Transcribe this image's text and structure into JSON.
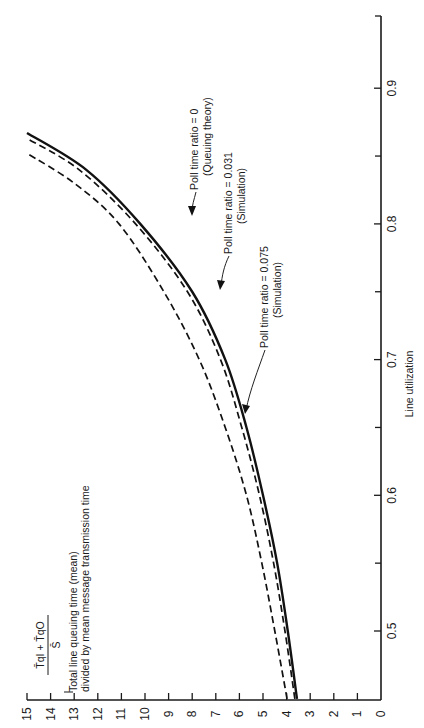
{
  "chart_data": {
    "type": "line",
    "orientation": "rotated-90-ccw",
    "title": "",
    "xlabel": "Line utilization",
    "ylabel": "Total line queuing time (mean) divided by mean message transmission time",
    "ylabel_formula": "(T̄q_I + T̄q_O) / S̄",
    "ylabel_lines": [
      "Total line queuing time (mean)",
      "divided by mean message transmission time"
    ],
    "formula": {
      "numerator": "T̄qI + T̄qO",
      "denominator": "S̄"
    },
    "xlim": [
      0.45,
      0.95
    ],
    "ylim": [
      0,
      15
    ],
    "x_ticks": [
      0.5,
      0.6,
      0.7,
      0.8,
      0.9
    ],
    "x_tick_labels": [
      "0.5",
      "0.6",
      "0.7",
      "0.8",
      "0.9"
    ],
    "x_minor_ticks": [
      0.55,
      0.65,
      0.75,
      0.85
    ],
    "y_ticks": [
      0,
      1,
      2,
      3,
      4,
      5,
      6,
      7,
      8,
      9,
      10,
      11,
      12,
      13,
      14,
      15
    ],
    "y_tick_labels": [
      "0",
      "1",
      "2",
      "3",
      "4",
      "5",
      "6",
      "7",
      "8",
      "9",
      "10",
      "11",
      "12",
      "13",
      "14",
      "15"
    ],
    "grid": false,
    "series": [
      {
        "name": "Poll time ratio = 0 (Queuing theory)",
        "style": "solid",
        "x": [
          0.45,
          0.5,
          0.55,
          0.6,
          0.65,
          0.7,
          0.75,
          0.8,
          0.84,
          0.867
        ],
        "y": [
          3.56,
          3.95,
          4.4,
          5.0,
          5.7,
          6.6,
          8.0,
          10.2,
          12.5,
          15.0
        ]
      },
      {
        "name": "Poll time ratio = 0.031 (Simulation)",
        "style": "dashed",
        "x": [
          0.45,
          0.5,
          0.55,
          0.6,
          0.65,
          0.7,
          0.75,
          0.8,
          0.84,
          0.863
        ],
        "y": [
          3.65,
          4.07,
          4.55,
          5.15,
          5.9,
          6.8,
          8.2,
          10.4,
          12.8,
          15.0
        ]
      },
      {
        "name": "Poll time ratio = 0.075 (Simulation)",
        "style": "dashed",
        "x": [
          0.45,
          0.5,
          0.55,
          0.6,
          0.65,
          0.7,
          0.75,
          0.8,
          0.83,
          0.852
        ],
        "y": [
          3.98,
          4.5,
          5.05,
          5.7,
          6.6,
          7.7,
          9.2,
          11.1,
          13.0,
          15.0
        ]
      }
    ],
    "annotations": [
      {
        "text": "Poll time ratio = 0",
        "sub": "(Queuing theory)",
        "points_to": "series 0 near x=0.75"
      },
      {
        "text": "Poll time ratio = 0.031",
        "sub": "(Simulation)",
        "points_to": "series 1 near x=0.70"
      },
      {
        "text": "Poll time ratio = 0.075",
        "sub": "(Simulation)",
        "points_to": "series 2 near x=0.62"
      }
    ]
  },
  "labels": {
    "xlabel": "Line utilization",
    "ylabel_line1": "Total line queuing time (mean)",
    "ylabel_line2": "divided by mean message transmission time",
    "formula_num": "T̄qI + T̄qO",
    "formula_den": "S̄",
    "ann0_line1": "Poll time ratio = 0",
    "ann0_line2": "(Queuing theory)",
    "ann1_line1": "Poll time ratio = 0.031",
    "ann1_line2": "(Simulation)",
    "ann2_line1": "Poll time ratio = 0.075",
    "ann2_line2": "(Simulation)"
  }
}
